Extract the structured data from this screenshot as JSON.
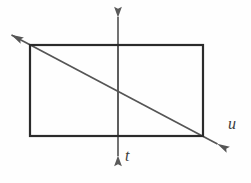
{
  "figure": {
    "background_color": "#fefefe",
    "rect_stroke_color": "#2b2b2b",
    "axis_stroke_color": "#5a5a5a",
    "diagonal_stroke_color": "#555555",
    "label_color": "#3c3c3c",
    "rectangle": {
      "name": "rectangle",
      "x1": 30,
      "y1": 45,
      "x2": 203,
      "y2": 136,
      "stroke_width": 2.2
    },
    "vertical_axis": {
      "name": "t-axis",
      "label": "t",
      "x": 118,
      "y_top": 10,
      "y_bottom": 163,
      "stroke_width": 1.7,
      "arrow_up": true,
      "arrow_down": true
    },
    "diagonal_axis": {
      "name": "u-axis",
      "label": "u",
      "x1": 4,
      "y1": 31,
      "x2": 225,
      "y2": 148,
      "stroke_width": 1.7,
      "arrow_start": true,
      "arrow_end": true
    },
    "labels": {
      "t": "t",
      "u": "u"
    }
  }
}
